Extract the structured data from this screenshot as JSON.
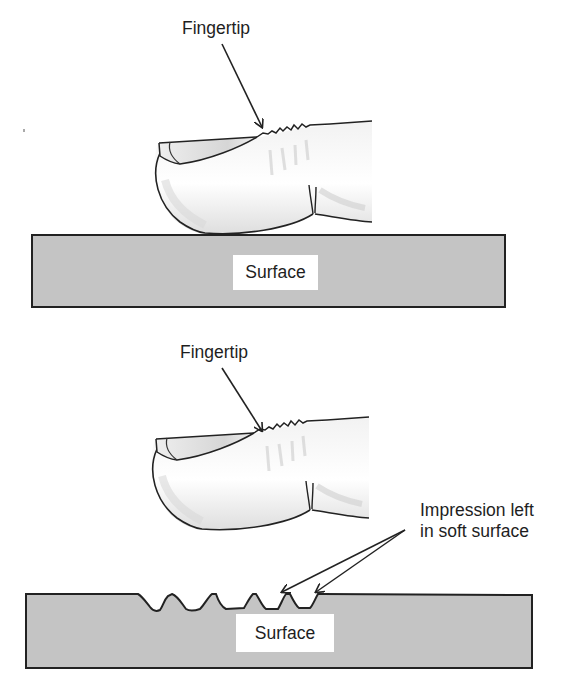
{
  "figure": {
    "panel_top": {
      "fingertip_label": "Fingertip",
      "surface_label": "Surface",
      "surface_type": "hard surface, finger resting on top"
    },
    "panel_bottom": {
      "fingertip_label": "Fingertip",
      "surface_label": "Surface",
      "annotation": {
        "line1": "Impression left",
        "line2": "in soft surface"
      },
      "impression_count": 5
    },
    "colors": {
      "surface_fill": "#c4c4c4",
      "outline": "#222222",
      "text": "#1e1e1e",
      "label_bg": "#ffffff",
      "finger_shading": "#d9d9d9"
    }
  }
}
